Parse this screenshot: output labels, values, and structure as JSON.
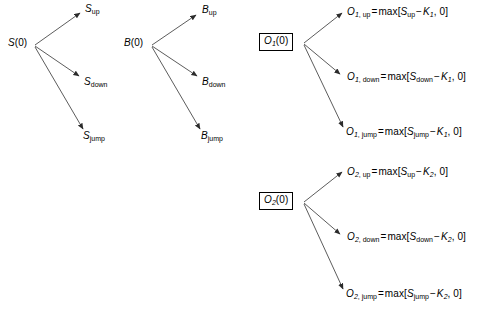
{
  "diagram": {
    "background_color": "#ffffff",
    "stroke_color": "#000000"
  },
  "trees": [
    {
      "id": "stock-tree",
      "root": {
        "base": "S",
        "arg": "(0)",
        "boxed": false
      },
      "branches": [
        {
          "key": "up",
          "base": "S",
          "subscript": "up"
        },
        {
          "key": "down",
          "base": "S",
          "subscript": "down"
        },
        {
          "key": "jump",
          "base": "S",
          "subscript": "jump"
        }
      ]
    },
    {
      "id": "bond-tree",
      "root": {
        "base": "B",
        "arg": "(0)",
        "boxed": false
      },
      "branches": [
        {
          "key": "up",
          "base": "B",
          "subscript": "up"
        },
        {
          "key": "down",
          "base": "B",
          "subscript": "down"
        },
        {
          "key": "jump",
          "base": "B",
          "subscript": "jump"
        }
      ]
    },
    {
      "id": "option1-tree",
      "root": {
        "base": "O",
        "index": "1",
        "arg": "(0)",
        "boxed": true
      },
      "branches": [
        {
          "key": "up",
          "lhs_base": "O",
          "lhs_index": "1",
          "lhs_state": "up",
          "equals": "=",
          "func": "max",
          "open": "[",
          "arg_base": "S",
          "arg_state": "up",
          "minus": "−",
          "strike_base": "K",
          "strike_index": "1",
          "comma": ", ",
          "zero": "0",
          "close": "]"
        },
        {
          "key": "down",
          "lhs_base": "O",
          "lhs_index": "1",
          "lhs_state": "down",
          "equals": "=",
          "func": "max",
          "open": "[",
          "arg_base": "S",
          "arg_state": "down",
          "minus": "−",
          "strike_base": "K",
          "strike_index": "1",
          "comma": ", ",
          "zero": "0",
          "close": "]"
        },
        {
          "key": "jump",
          "lhs_base": "O",
          "lhs_index": "1",
          "lhs_state": "jump",
          "equals": "=",
          "func": "max",
          "open": "[",
          "arg_base": "S",
          "arg_state": "jump",
          "minus": "−",
          "strike_base": "K",
          "strike_index": "1",
          "comma": ", ",
          "zero": "0",
          "close": "]"
        }
      ]
    },
    {
      "id": "option2-tree",
      "root": {
        "base": "O",
        "index": "2",
        "arg": "(0)",
        "boxed": true
      },
      "branches": [
        {
          "key": "up",
          "lhs_base": "O",
          "lhs_index": "2",
          "lhs_state": "up",
          "equals": "=",
          "func": "max",
          "open": "[",
          "arg_base": "S",
          "arg_state": "up",
          "minus": "−",
          "strike_base": "K",
          "strike_index": "2",
          "comma": ", ",
          "zero": "0",
          "close": "]"
        },
        {
          "key": "down",
          "lhs_base": "O",
          "lhs_index": "2",
          "lhs_state": "down",
          "equals": "=",
          "func": "max",
          "open": "[",
          "arg_base": "S",
          "arg_state": "down",
          "minus": "−",
          "strike_base": "K",
          "strike_index": "2",
          "comma": ", ",
          "zero": "0",
          "close": "]"
        },
        {
          "key": "jump",
          "lhs_base": "O",
          "lhs_index": "2",
          "lhs_state": "jump",
          "equals": "=",
          "func": "max",
          "open": "[",
          "arg_base": "S",
          "arg_state": "jump",
          "minus": "−",
          "strike_base": "K",
          "strike_index": "2",
          "comma": ", ",
          "zero": "0",
          "close": "]"
        }
      ]
    }
  ],
  "labels": {
    "stock": {
      "root": "S(0)",
      "up": "S_up",
      "down": "S_down",
      "jump": "S_jump"
    },
    "bond": {
      "root": "B(0)",
      "up": "B_up",
      "down": "B_down",
      "jump": "B_jump"
    },
    "option1": {
      "root": "O_1(0)",
      "up": "O_1,up = max[S_up - K_1, 0]",
      "down": "O_1,down = max[S_down - K_1, 0]",
      "jump": "O_1,jump = max[S_jump - K_1, 0]"
    },
    "option2": {
      "root": "O_2(0)",
      "up": "O_2,up = max[S_up - K_2, 0]",
      "down": "O_2,down = max[S_down - K_2, 0]",
      "jump": "O_2,jump = max[S_jump - K_2, 0]"
    }
  }
}
